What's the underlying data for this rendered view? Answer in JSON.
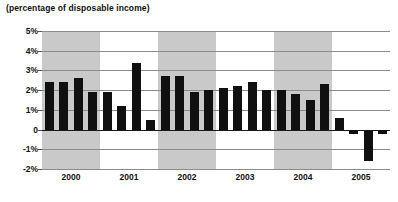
{
  "chart_data": {
    "type": "bar",
    "title": "",
    "subtitle": "(percentage of disposable income)",
    "xlabel": "",
    "ylabel": "",
    "ylim": [
      -2,
      5
    ],
    "yticks": [
      5,
      4,
      3,
      2,
      1,
      0,
      -1,
      -2
    ],
    "ytick_labels": [
      "5%",
      "4%",
      "3%",
      "2%",
      "1%",
      "0",
      "-1%",
      "-2%"
    ],
    "grid": true,
    "legend": "none",
    "categories": [
      "2000 Q1",
      "2000 Q2",
      "2000 Q3",
      "2000 Q4",
      "2001 Q1",
      "2001 Q2",
      "2001 Q3",
      "2001 Q4",
      "2002 Q1",
      "2002 Q2",
      "2002 Q3",
      "2002 Q4",
      "2003 Q1",
      "2003 Q2",
      "2003 Q3",
      "2003 Q4",
      "2004 Q1",
      "2004 Q2",
      "2004 Q3",
      "2004 Q4",
      "2005 Q1",
      "2005 Q2",
      "2005 Q3",
      "2005 Q4"
    ],
    "values": [
      2.4,
      2.4,
      2.6,
      1.9,
      1.9,
      1.2,
      3.4,
      0.5,
      2.7,
      2.7,
      1.9,
      2.0,
      2.1,
      2.2,
      2.4,
      2.0,
      2.0,
      1.8,
      1.5,
      2.3,
      0.6,
      -0.2,
      -1.6,
      -0.2
    ],
    "x_group_labels": [
      "2000",
      "2001",
      "2002",
      "2003",
      "2004",
      "2005"
    ],
    "shaded_groups": [
      "2000",
      "2002",
      "2004"
    ],
    "bar_color": "#101010",
    "band_color": "#c9c9c9",
    "grid_color": "#8b8b8b",
    "zero_line_color": "#1a1a1a"
  }
}
